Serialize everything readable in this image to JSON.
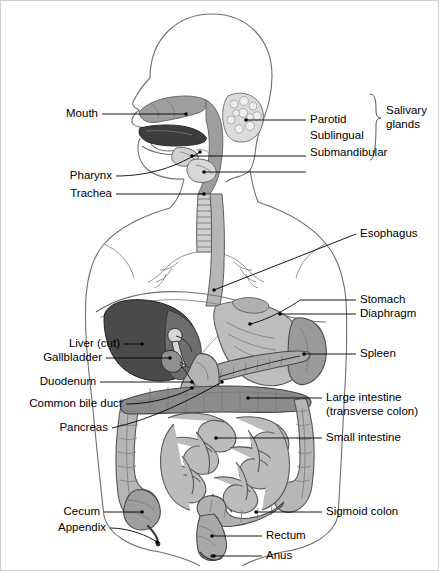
{
  "figure": {
    "border_color": "#c9c9c9",
    "background": "#ffffff",
    "line_color": "#000000",
    "organ_colors": {
      "body_outline": "#7d7d7d",
      "liver_cut": "#4a4a4a",
      "tongue": "#3d3d3d",
      "stomach": "#b8b8b8",
      "spleen": "#9a9a9a",
      "intestine": "#b0b0b0",
      "pharynx_airway": "#9e9e9e",
      "salivary_gland": "#d8d8d8",
      "transverse_colon": "#8c8c8c"
    }
  },
  "labels": {
    "left": [
      {
        "id": "mouth",
        "text": "Mouth"
      },
      {
        "id": "pharynx",
        "text": "Pharynx"
      },
      {
        "id": "trachea",
        "text": "Trachea"
      },
      {
        "id": "liver-cut",
        "text": "Liver (cut)"
      },
      {
        "id": "gallbladder",
        "text": "Gallbladder"
      },
      {
        "id": "duodenum",
        "text": "Duodenum"
      },
      {
        "id": "common-bile-duct",
        "text": "Common bile duct"
      },
      {
        "id": "pancreas",
        "text": "Pancreas"
      },
      {
        "id": "cecum",
        "text": "Cecum"
      },
      {
        "id": "appendix",
        "text": "Appendix"
      }
    ],
    "right": [
      {
        "id": "parotid",
        "text": "Parotid"
      },
      {
        "id": "sublingual",
        "text": "Sublingual"
      },
      {
        "id": "submandibular",
        "text": "Submandibular"
      },
      {
        "id": "esophagus",
        "text": "Esophagus"
      },
      {
        "id": "stomach",
        "text": "Stomach"
      },
      {
        "id": "diaphragm",
        "text": "Diaphragm"
      },
      {
        "id": "spleen",
        "text": "Spleen"
      },
      {
        "id": "large-intestine",
        "text": "Large intestine"
      },
      {
        "id": "large-intestine-2",
        "text": "(transverse colon)"
      },
      {
        "id": "small-intestine",
        "text": "Small intestine"
      },
      {
        "id": "sigmoid-colon",
        "text": "Sigmoid colon"
      },
      {
        "id": "rectum",
        "text": "Rectum"
      },
      {
        "id": "anus",
        "text": "Anus"
      }
    ],
    "group": {
      "id": "salivary-glands",
      "line1": "Salivary",
      "line2": "glands"
    }
  }
}
